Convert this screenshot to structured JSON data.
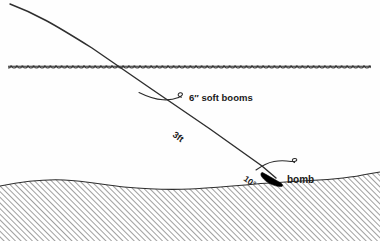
{
  "diagram": {
    "labels": {
      "soft_booms": "6″ soft booms",
      "length": "3ft",
      "angle": "10°",
      "bomb": "bomb"
    },
    "colors": {
      "ink": "#1a1a1a",
      "line": "#333333",
      "hatch": "#555555",
      "background": "#fefefe",
      "bomb_fill": "#000000"
    },
    "regions": {
      "water_surface_label": "water surface",
      "seabed_label": "seabed",
      "cable_label": "boom cable"
    }
  }
}
